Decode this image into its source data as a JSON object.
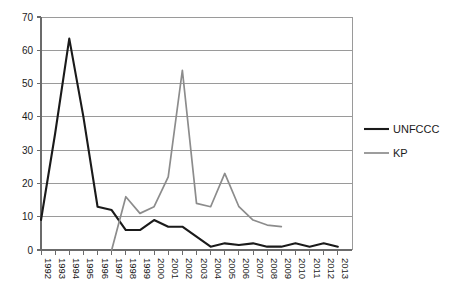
{
  "chart_data": {
    "type": "line",
    "title": "",
    "xlabel": "",
    "ylabel": "",
    "ylim": [
      0,
      70
    ],
    "ytick_step": 10,
    "yticks": [
      "0",
      "10",
      "20",
      "30",
      "40",
      "50",
      "60",
      "70"
    ],
    "grid": true,
    "legend_position": "right",
    "categories": [
      "1992",
      "1993",
      "1994",
      "1995",
      "1996",
      "1997",
      "1998",
      "1999",
      "2000",
      "2001",
      "2002",
      "2003",
      "2004",
      "2005",
      "2006",
      "2007",
      "2008",
      "2009",
      "2010",
      "2011",
      "2012",
      "2013"
    ],
    "series": [
      {
        "name": "UNFCCC",
        "color": "#1a1a1a",
        "values": [
          9,
          35,
          63.5,
          40,
          13,
          12,
          6,
          6,
          9,
          7,
          7,
          4,
          1,
          2,
          1.5,
          2,
          1,
          1,
          2,
          1,
          2,
          1
        ]
      },
      {
        "name": "KP",
        "color": "#8c8c8c",
        "values": [
          null,
          null,
          null,
          null,
          null,
          0,
          16,
          11,
          13,
          22,
          54,
          14,
          13,
          23,
          13,
          9,
          7.5,
          7,
          null,
          null,
          null,
          null
        ]
      }
    ]
  },
  "legend": {
    "items": [
      {
        "label": "UNFCCC",
        "color": "#1a1a1a"
      },
      {
        "label": "KP",
        "color": "#8c8c8c"
      }
    ]
  },
  "axes": {
    "y_min_label": "0",
    "y_max_label": "70"
  }
}
